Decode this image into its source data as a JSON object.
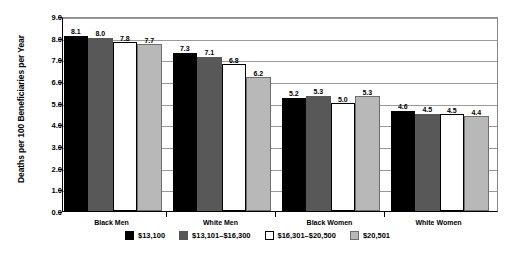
{
  "chart_data": {
    "type": "bar",
    "title": "",
    "xlabel": "",
    "ylabel": "Deaths per 100 Beneficiaries per Year",
    "ylim": [
      0.0,
      9.0
    ],
    "ytick_step": 1.0,
    "ytick_labels": [
      "9.0",
      "8.0",
      "7.0",
      "6.0",
      "5.0",
      "4.0",
      "3.0",
      "2.0",
      "1.0",
      "0.0"
    ],
    "ytick_values": [
      9.0,
      8.0,
      7.0,
      6.0,
      5.0,
      4.0,
      3.0,
      2.0,
      1.0,
      0.0
    ],
    "grid": true,
    "grid_axis": "y",
    "legend_position": "bottom",
    "categories": [
      "Black Men",
      "White Men",
      "Black Women",
      "White Women"
    ],
    "series": [
      {
        "name": "$13,100",
        "color": "#000000",
        "values": [
          8.1,
          7.3,
          5.2,
          4.6
        ],
        "labels": [
          "8.1",
          "7.3",
          "5.2",
          "4.6"
        ]
      },
      {
        "name": "$13,101–$16,300",
        "color": "#585858",
        "values": [
          8.0,
          7.1,
          5.3,
          4.5
        ],
        "labels": [
          "8.0",
          "7.1",
          "5.3",
          "4.5"
        ]
      },
      {
        "name": "$16,301–$20,500",
        "color": "#ffffff",
        "values": [
          7.8,
          6.8,
          5.0,
          4.5
        ],
        "labels": [
          "7.8",
          "6.8",
          "5.0",
          "4.5"
        ]
      },
      {
        "name": "$20,501",
        "color": "#b8b8b8",
        "values": [
          7.7,
          6.2,
          5.3,
          4.4
        ],
        "labels": [
          "7.7",
          "6.2",
          "5.3",
          "4.4"
        ]
      }
    ]
  }
}
